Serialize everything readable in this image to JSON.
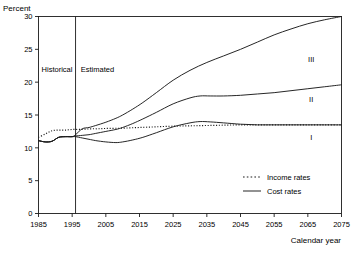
{
  "chart_data": {
    "type": "line",
    "title": "",
    "xlabel": "Calendar year",
    "ylabel": "Percent",
    "xlim": [
      1985,
      2075
    ],
    "ylim": [
      0,
      30
    ],
    "yticks": [
      0,
      5,
      10,
      15,
      20,
      25,
      30
    ],
    "xticks": [
      1985,
      1995,
      2005,
      2015,
      2025,
      2035,
      2045,
      2055,
      2065,
      2075
    ],
    "grid": false,
    "legend_position": "inside-lower-right",
    "legend": [
      {
        "name": "Income rates",
        "style": "dotted"
      },
      {
        "name": "Cost rates",
        "style": "solid"
      }
    ],
    "annotations": [
      {
        "text": "Historical",
        "x": 1990.5,
        "y": 21.5
      },
      {
        "text": "Estimated",
        "x": 2002.5,
        "y": 21.5
      },
      {
        "text": "III",
        "x": 2066,
        "y": 23.0
      },
      {
        "text": "II",
        "x": 2066,
        "y": 17.0
      },
      {
        "text": "I",
        "x": 2066,
        "y": 11.2
      }
    ],
    "divider_x": 1996,
    "series": [
      {
        "name": "Income rates",
        "style": "dotted",
        "x": [
          1985,
          1987,
          1989,
          1991,
          1993,
          1995,
          1997,
          1999,
          2001,
          2003,
          2005,
          2010,
          2015,
          2020,
          2025,
          2030,
          2035,
          2040,
          2045,
          2050,
          2055,
          2060,
          2065,
          2070,
          2075
        ],
        "values": [
          11.6,
          12.1,
          12.6,
          12.7,
          12.7,
          12.8,
          12.8,
          12.85,
          12.9,
          12.9,
          12.95,
          13.0,
          13.1,
          13.2,
          13.3,
          13.35,
          13.4,
          13.45,
          13.5,
          13.5,
          13.5,
          13.5,
          13.5,
          13.5,
          13.5
        ]
      },
      {
        "name": "Cost rate I (low cost)",
        "label": "I",
        "style": "solid",
        "x": [
          1985,
          1987,
          1989,
          1991,
          1993,
          1995,
          1996,
          1998,
          2000,
          2002,
          2005,
          2008,
          2010,
          2013,
          2016,
          2020,
          2025,
          2030,
          2033,
          2036,
          2040,
          2045,
          2050,
          2055,
          2060,
          2065,
          2070,
          2075
        ],
        "values": [
          11.1,
          10.9,
          11.0,
          11.6,
          11.7,
          11.7,
          11.7,
          11.5,
          11.3,
          11.1,
          10.9,
          10.8,
          10.9,
          11.2,
          11.6,
          12.3,
          13.2,
          13.8,
          14.0,
          13.95,
          13.8,
          13.6,
          13.5,
          13.5,
          13.5,
          13.5,
          13.5,
          13.5
        ]
      },
      {
        "name": "Cost rate II (intermediate)",
        "label": "II",
        "style": "solid",
        "x": [
          1985,
          1987,
          1989,
          1991,
          1993,
          1995,
          1996,
          1998,
          2000,
          2002,
          2005,
          2008,
          2010,
          2013,
          2016,
          2020,
          2025,
          2030,
          2033,
          2036,
          2040,
          2045,
          2050,
          2055,
          2060,
          2065,
          2070,
          2075
        ],
        "values": [
          11.1,
          10.9,
          11.0,
          11.6,
          11.7,
          11.7,
          11.8,
          11.9,
          12.0,
          12.2,
          12.5,
          12.8,
          13.1,
          13.7,
          14.4,
          15.4,
          16.7,
          17.6,
          17.9,
          17.9,
          17.9,
          18.0,
          18.2,
          18.4,
          18.7,
          19.0,
          19.3,
          19.6
        ]
      },
      {
        "name": "Cost rate III (high cost)",
        "label": "III",
        "style": "solid",
        "x": [
          1985,
          1987,
          1989,
          1991,
          1993,
          1995,
          1996,
          1998,
          2000,
          2002,
          2005,
          2008,
          2010,
          2013,
          2016,
          2020,
          2025,
          2030,
          2035,
          2040,
          2045,
          2050,
          2055,
          2060,
          2065,
          2070,
          2075
        ],
        "values": [
          11.1,
          10.9,
          11.0,
          11.6,
          11.7,
          11.7,
          12.0,
          12.9,
          13.1,
          13.4,
          13.9,
          14.5,
          15.0,
          15.9,
          16.9,
          18.4,
          20.3,
          21.8,
          23.0,
          24.0,
          25.0,
          26.1,
          27.2,
          28.1,
          28.9,
          29.5,
          30.0
        ]
      }
    ]
  }
}
